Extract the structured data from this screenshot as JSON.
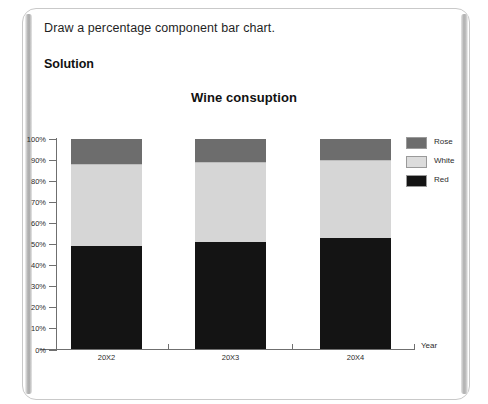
{
  "page": {
    "prompt": "Draw a percentage component bar chart.",
    "solution_heading": "Solution"
  },
  "chart_data": {
    "type": "bar",
    "stacked": true,
    "normalized_percent": true,
    "title": "Wine consuption",
    "xlabel": "Year",
    "ylabel": "",
    "categories": [
      "20X2",
      "20X3",
      "20X4"
    ],
    "ylim": [
      0,
      100
    ],
    "ytick_labels": [
      "0%",
      "10%",
      "20%",
      "30%",
      "40%",
      "50%",
      "60%",
      "70%",
      "80%",
      "90%",
      "100%"
    ],
    "ytick_values": [
      0,
      10,
      20,
      30,
      40,
      50,
      60,
      70,
      80,
      90,
      100
    ],
    "grid": false,
    "legend_position": "right",
    "series": [
      {
        "name": "Red",
        "color": "#141414",
        "values": [
          49,
          51,
          53
        ]
      },
      {
        "name": "White",
        "color": "#d6d6d6",
        "values": [
          39,
          38,
          37
        ]
      },
      {
        "name": "Rose",
        "color": "#6d6d6d",
        "values": [
          12,
          11,
          10
        ]
      }
    ],
    "legend_order": [
      "Rose",
      "White",
      "Red"
    ]
  }
}
